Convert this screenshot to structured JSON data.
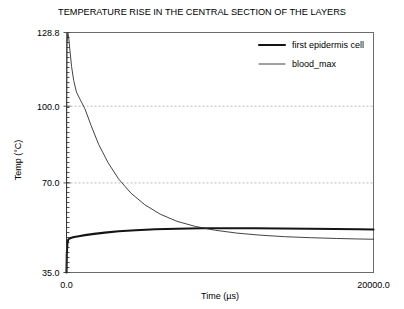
{
  "chart_data": {
    "type": "line",
    "title": "TEMPERATURE RISE IN THE CENTRAL SECTION OF THE LAYERS",
    "xlabel": "Time (µs)",
    "ylabel": "Temp (°C)",
    "xlim": [
      0.0,
      20000.0
    ],
    "ylim": [
      35.0,
      128.8
    ],
    "xticks": [
      0.0,
      20000.0
    ],
    "xtick_labels": [
      "0.0",
      "20000.0"
    ],
    "yticks": [
      35.0,
      70.0,
      100.0,
      128.8
    ],
    "ytick_labels": [
      "35.0",
      "70.0",
      "100.0",
      "128.8"
    ],
    "gridlines_y": [
      70.0,
      100.0
    ],
    "gridlines_x": [
      0.0
    ],
    "grid": true,
    "legend_position": "top-right",
    "series": [
      {
        "name": "first epidermis cell",
        "style": "thick",
        "x": [
          0,
          20,
          60,
          120,
          200,
          320,
          500,
          800,
          1200,
          1800,
          2500,
          3400,
          4500,
          5800,
          7200,
          8800,
          10500,
          12200,
          14000,
          15800,
          17500,
          19000,
          20000
        ],
        "y": [
          35.0,
          42.5,
          46.6,
          47.9,
          48.3,
          48.6,
          48.9,
          49.2,
          49.6,
          50.1,
          50.6,
          51.1,
          51.5,
          51.9,
          52.1,
          52.3,
          52.3,
          52.3,
          52.2,
          52.1,
          52.0,
          51.9,
          51.8
        ]
      },
      {
        "name": "blood_max",
        "style": "thin",
        "x": [
          0,
          15,
          40,
          80,
          140,
          220,
          330,
          470,
          650,
          900,
          1200,
          1600,
          2100,
          2700,
          3400,
          4200,
          5100,
          6100,
          7200,
          8400,
          9700,
          11100,
          12600,
          14200,
          15900,
          17600,
          19000,
          20000
        ],
        "y": [
          35.0,
          98.0,
          124.0,
          128.8,
          127.0,
          122.0,
          115.5,
          110.0,
          105.5,
          102.5,
          99.0,
          92.5,
          85.0,
          78.0,
          71.5,
          66.0,
          61.5,
          57.8,
          55.0,
          53.0,
          51.5,
          50.4,
          49.6,
          49.0,
          48.6,
          48.3,
          48.1,
          48.0
        ]
      }
    ]
  }
}
